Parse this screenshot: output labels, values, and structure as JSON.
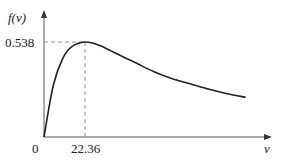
{
  "chart_data": {
    "type": "line",
    "title": "",
    "xlabel": "v",
    "ylabel": "f(v)",
    "x_tick_labels": [
      "0",
      "22.36"
    ],
    "y_tick_labels": [
      "0.538"
    ],
    "peak": {
      "x": 22.36,
      "y": 0.538
    },
    "annotations": [
      "dashed guide lines from peak to both axes"
    ],
    "grid": false,
    "legend": null,
    "series": [
      {
        "name": "f(v)",
        "x": [
          0,
          5,
          10,
          15,
          22.36,
          30,
          40,
          50,
          60,
          70,
          80,
          90,
          100,
          110,
          120
        ],
        "y": [
          0,
          0.29,
          0.44,
          0.51,
          0.538,
          0.52,
          0.47,
          0.42,
          0.37,
          0.33,
          0.3,
          0.27,
          0.245,
          0.225,
          0.21
        ]
      }
    ],
    "xlim": [
      0,
      125
    ],
    "ylim": [
      0,
      0.66
    ]
  },
  "labels": {
    "y_axis": "f(v)",
    "x_axis": "v",
    "origin": "0",
    "peak_x": "22.36",
    "peak_y": "0.538"
  }
}
